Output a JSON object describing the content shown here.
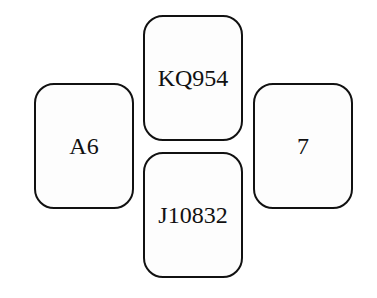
{
  "hands": {
    "north": {
      "cards": "KQ954"
    },
    "west": {
      "cards": "A6"
    },
    "east": {
      "cards": "7"
    },
    "south": {
      "cards": "J10832"
    }
  }
}
